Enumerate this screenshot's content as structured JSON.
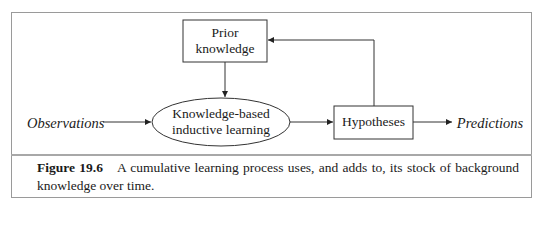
{
  "diagram": {
    "nodes": {
      "prior_knowledge": {
        "label_line1": "Prior",
        "label_line2": "knowledge",
        "shape": "rectangle"
      },
      "learning": {
        "label_line1": "Knowledge-based",
        "label_line2": "inductive learning",
        "shape": "ellipse"
      },
      "hypotheses": {
        "label": "Hypotheses",
        "shape": "rectangle"
      },
      "observations": {
        "label": "Observations",
        "shape": "text-italic"
      },
      "predictions": {
        "label": "Predictions",
        "shape": "text-italic"
      }
    },
    "edges": [
      {
        "from": "observations",
        "to": "learning"
      },
      {
        "from": "prior_knowledge",
        "to": "learning"
      },
      {
        "from": "learning",
        "to": "hypotheses"
      },
      {
        "from": "hypotheses",
        "to": "predictions"
      },
      {
        "from": "hypotheses",
        "to": "prior_knowledge"
      }
    ],
    "colors": {
      "stroke": "#333333",
      "frame": "#9a9a9a",
      "text": "#1a1a1a"
    }
  },
  "caption": {
    "label": "Figure 19.6",
    "text": "A cumulative learning process uses, and adds to, its stock of background knowledge over time."
  }
}
